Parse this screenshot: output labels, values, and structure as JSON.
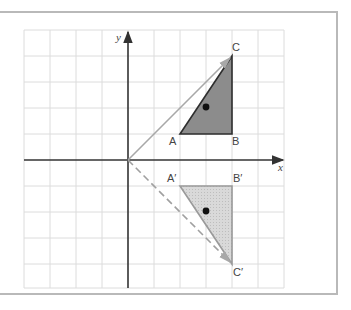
{
  "diagram": {
    "type": "coordinate-grid-reflection",
    "grid": {
      "x_min": -4,
      "x_max": 6,
      "y_min": -5,
      "y_max": 5,
      "cell_px": 26
    },
    "axes": {
      "x_label": "x",
      "y_label": "y"
    },
    "colors": {
      "grid": "#dcdcdc",
      "axis": "#333333",
      "original_fill": "#8c8c8c",
      "original_stroke": "#2e2e2e",
      "image_fill": "#d6d6d6",
      "image_stroke": "#9a9a9a",
      "vector": "#9e9e9e",
      "point": "#111111"
    },
    "original_triangle": {
      "vertices": [
        {
          "label": "A",
          "x": 2,
          "y": 1
        },
        {
          "label": "B",
          "x": 4,
          "y": 1
        },
        {
          "label": "C",
          "x": 4,
          "y": 4
        }
      ],
      "marked_point": {
        "x": 3,
        "y": 2
      }
    },
    "image_triangle": {
      "vertices": [
        {
          "label": "A′",
          "x": 2,
          "y": -1
        },
        {
          "label": "B′",
          "x": 4,
          "y": -1
        },
        {
          "label": "C′",
          "x": 4,
          "y": -4
        }
      ],
      "marked_point": {
        "x": 3,
        "y": -2
      }
    },
    "vectors": [
      {
        "from": [
          0,
          0
        ],
        "to": [
          4,
          4
        ],
        "style": "solid",
        "label": "O to C"
      },
      {
        "from": [
          0,
          0
        ],
        "to": [
          4,
          -4
        ],
        "style": "dashed",
        "label": "O to C′"
      }
    ]
  }
}
